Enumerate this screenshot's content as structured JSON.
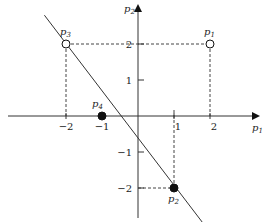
{
  "diagram": {
    "x_axis_label": "p",
    "x_axis_sub": "1",
    "y_axis_label": "p",
    "y_axis_sub": "2",
    "x_ticks": [
      {
        "value": -2,
        "label": "−2"
      },
      {
        "value": -1,
        "label": "−1"
      },
      {
        "value": 1,
        "label": "1"
      },
      {
        "value": 2,
        "label": "2"
      }
    ],
    "y_ticks": [
      {
        "value": 2,
        "label": "2"
      },
      {
        "value": 1,
        "label": "1"
      },
      {
        "value": -1,
        "label": "−1"
      },
      {
        "value": -2,
        "label": "−2"
      }
    ],
    "points": [
      {
        "name": "p",
        "sub": "1",
        "x": 2,
        "y": 2,
        "filled": false
      },
      {
        "name": "p",
        "sub": "2",
        "x": 1,
        "y": -2,
        "filled": true
      },
      {
        "name": "p",
        "sub": "3",
        "x": -2,
        "y": 2,
        "filled": false
      },
      {
        "name": "p",
        "sub": "4",
        "x": -1,
        "y": 0,
        "filled": true
      }
    ],
    "line": {
      "description": "decision boundary",
      "from": [
        -2.6,
        2.8
      ],
      "to": [
        1.9,
        -3.1
      ]
    },
    "colors": {
      "ink": "#222222",
      "dash": "#444444"
    }
  }
}
